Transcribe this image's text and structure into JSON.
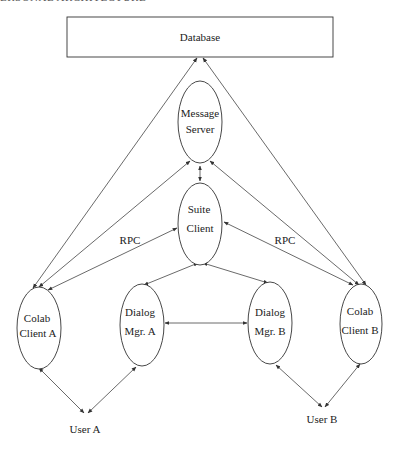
{
  "header": {
    "running_title": "ERSONAL ARCHITECTURE"
  },
  "nodes": {
    "database": {
      "label": "Database"
    },
    "message_server": {
      "lines": [
        "Message",
        "Server"
      ]
    },
    "suite_client": {
      "lines": [
        "Suite",
        "Client"
      ]
    },
    "colab_client_a": {
      "lines": [
        "Colab",
        "Client A"
      ]
    },
    "dialog_mgr_a": {
      "lines": [
        "Dialog",
        "Mgr. A"
      ]
    },
    "dialog_mgr_b": {
      "lines": [
        "Dialog",
        "Mgr. B"
      ]
    },
    "colab_client_b": {
      "lines": [
        "Colab",
        "Client B"
      ]
    },
    "user_a": {
      "label": "User A"
    },
    "user_b": {
      "label": "User B"
    }
  },
  "edge_labels": {
    "rpc_left": "RPC",
    "rpc_right": "RPC"
  },
  "edges": [
    {
      "from": "colab_client_a",
      "to": "database",
      "arrows": "both"
    },
    {
      "from": "colab_client_b",
      "to": "database",
      "arrows": "both"
    },
    {
      "from": "colab_client_a",
      "to": "message_server",
      "arrows": "both"
    },
    {
      "from": "colab_client_b",
      "to": "message_server",
      "arrows": "both"
    },
    {
      "from": "message_server",
      "to": "suite_client",
      "arrows": "both"
    },
    {
      "from": "colab_client_a",
      "to": "suite_client",
      "arrows": "both",
      "label": "RPC"
    },
    {
      "from": "colab_client_b",
      "to": "suite_client",
      "arrows": "both",
      "label": "RPC"
    },
    {
      "from": "suite_client",
      "to": "dialog_mgr_a",
      "arrows": "both"
    },
    {
      "from": "suite_client",
      "to": "dialog_mgr_b",
      "arrows": "both"
    },
    {
      "from": "dialog_mgr_a",
      "to": "dialog_mgr_b",
      "arrows": "both"
    },
    {
      "from": "user_a",
      "to": "colab_client_a",
      "arrows": "both"
    },
    {
      "from": "user_a",
      "to": "dialog_mgr_a",
      "arrows": "both"
    },
    {
      "from": "user_b",
      "to": "dialog_mgr_b",
      "arrows": "both"
    },
    {
      "from": "user_b",
      "to": "colab_client_b",
      "arrows": "both"
    }
  ]
}
